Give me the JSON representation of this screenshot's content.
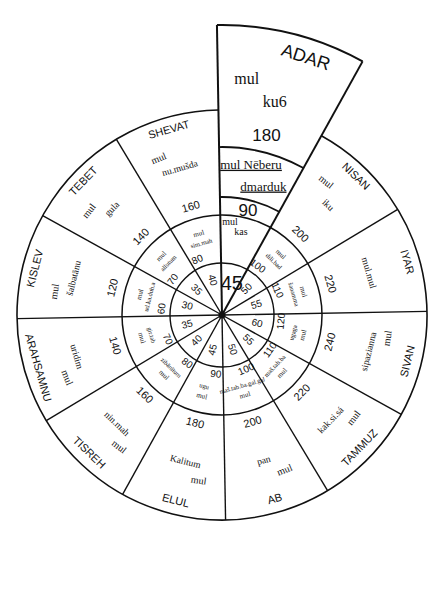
{
  "diagram": {
    "center": {
      "x": 222,
      "y": 315
    },
    "radii": {
      "inner": 52,
      "middle": 100,
      "outer": 205,
      "adar_outer": 290,
      "adar_middle": 168
    },
    "line_color": "#111111",
    "background": "#ffffff",
    "center_dot_label": "",
    "months": [
      {
        "name": "ADAR",
        "star_prefix": "mul",
        "star": "ku6",
        "outer_value": "180",
        "middle_star_prefix": "mul Nēberu",
        "middle_star": "dmarduk",
        "middle_value": "90",
        "inner_prefix": "mul",
        "inner_star": "kas",
        "inner_value": "45"
      },
      {
        "name": "NISAN",
        "star_prefix": "mul",
        "star": "iku",
        "outer_value": "200",
        "middle_star_prefix": "mul",
        "middle_star": "dili.bad",
        "middle_value": "100",
        "inner_prefix": "mul",
        "inner_star": "a",
        "inner_value": "50"
      },
      {
        "name": "IYAR",
        "star_prefix": "",
        "star": "mul.mul",
        "outer_value": "220",
        "middle_star_prefix": "mul",
        "middle_star": "šanamma",
        "middle_value": "110",
        "inner_prefix": "",
        "inner_star": "",
        "inner_value": "55"
      },
      {
        "name": "SIVAN",
        "star_prefix": "mul",
        "star": "sipazianna",
        "outer_value": "240",
        "middle_star_prefix": "mul",
        "middle_star": "ugaga",
        "middle_value": "120",
        "inner_prefix": "mul",
        "inner_star": "",
        "inner_value": "60"
      },
      {
        "name": "TAMMUZ",
        "star_prefix": "mul",
        "star": "kak.si.sá",
        "outer_value": "220",
        "middle_star_prefix": "mul",
        "middle_star": "maš.tab.ba",
        "middle_value": "110",
        "inner_prefix": "mul",
        "inner_star": "",
        "inner_value": "55"
      },
      {
        "name": "AB",
        "star_prefix": "mul",
        "star": "pan",
        "outer_value": "200",
        "middle_star_prefix": "mul",
        "middle_star": "maš.tab.ba.gal.gal",
        "middle_value": "100",
        "inner_prefix": "mul",
        "inner_star": "",
        "inner_value": "50"
      },
      {
        "name": "ELUL",
        "star_prefix": "mul",
        "star": "Kalitum",
        "outer_value": "180",
        "middle_star_prefix": "mul",
        "middle_star": "ugu",
        "middle_value": "90",
        "inner_prefix": "mul",
        "inner_star": "",
        "inner_value": "45"
      },
      {
        "name": "TISREH",
        "star_prefix": "mul",
        "star": "nin.mah",
        "outer_value": "160",
        "middle_star_prefix": "mul",
        "middle_star": "zibānītum",
        "middle_value": "80",
        "inner_prefix": "mul",
        "inner_star": "",
        "inner_value": "40"
      },
      {
        "name": "ARAHSAMNU",
        "star_prefix": "mul",
        "star": "uridim",
        "outer_value": "140",
        "middle_star_prefix": "mul",
        "middle_star": "gir.tab",
        "middle_value": "70",
        "inner_prefix": "mul",
        "inner_star": "",
        "inner_value": "35"
      },
      {
        "name": "KISLEV",
        "star_prefix": "mul",
        "star": "šalbatānu",
        "outer_value": "120",
        "middle_star_prefix": "mul",
        "middle_star": "ud.ka.duh.a",
        "middle_value": "60",
        "inner_prefix": "mul",
        "inner_star": "",
        "inner_value": "30"
      },
      {
        "name": "TEBET",
        "star_prefix": "mul",
        "star": "gula",
        "outer_value": "140",
        "middle_star_prefix": "mul",
        "middle_star": "allutum",
        "middle_value": "70",
        "inner_prefix": "mul",
        "inner_star": "",
        "inner_value": "35"
      },
      {
        "name": "SHEVAT",
        "star_prefix": "mul",
        "star": "nu.mušda",
        "outer_value": "160",
        "middle_star_prefix": "mul",
        "middle_star": "sim.mah",
        "middle_value": "80",
        "inner_prefix": "mul",
        "inner_star": "dam",
        "inner_value": "40"
      }
    ]
  }
}
